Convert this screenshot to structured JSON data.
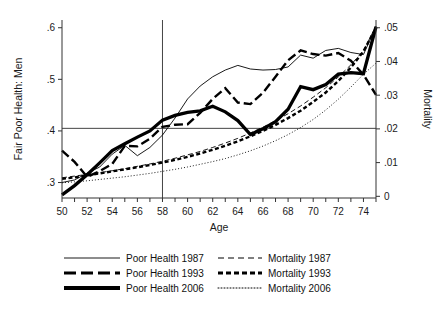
{
  "chart_data": {
    "type": "line",
    "title": "",
    "xlabel": "Age",
    "ylabel": "Fair Poor Health: Men",
    "y2label": "Mortality",
    "xlim": [
      50,
      75
    ],
    "ylim": [
      0.27,
      0.615
    ],
    "y2lim": [
      -0.0005,
      0.0523
    ],
    "grid": false,
    "legend_position": "bottom",
    "x_ticks_major": [
      50,
      52,
      54,
      56,
      58,
      60,
      62,
      64,
      66,
      68,
      70,
      72,
      74
    ],
    "x_ticks_minor": [
      51,
      53,
      55,
      57,
      59,
      61,
      63,
      65,
      67,
      69,
      71,
      73,
      75
    ],
    "x_tick_labels": [
      "50",
      "52",
      "54",
      "56",
      "58",
      "60",
      "62",
      "64",
      "66",
      "68",
      "70",
      "72",
      "74"
    ],
    "y_ticks": [
      0.3,
      0.4,
      0.5,
      0.6
    ],
    "y_tick_labels": [
      ".3",
      ".4",
      ".5",
      ".6"
    ],
    "y2_ticks": [
      0,
      0.01,
      0.02,
      0.03,
      0.04,
      0.05
    ],
    "y2_tick_labels": [
      "0",
      ".01",
      ".02",
      ".03",
      ".04",
      ".05"
    ],
    "reference_lines": [
      {
        "orientation": "vertical",
        "value": 58,
        "axis": "x"
      },
      {
        "orientation": "horizontal",
        "value": 0.405,
        "axis": "y"
      }
    ],
    "x": [
      50,
      51,
      52,
      53,
      54,
      55,
      56,
      57,
      58,
      59,
      60,
      61,
      62,
      63,
      64,
      65,
      66,
      67,
      68,
      69,
      70,
      71,
      72,
      73,
      74,
      75
    ],
    "series": [
      {
        "name": "Poor Health 1987",
        "axis": "left",
        "style": "solid",
        "width": "thin",
        "values": [
          0.3,
          0.305,
          0.318,
          0.33,
          0.355,
          0.372,
          0.352,
          0.368,
          0.392,
          0.425,
          0.462,
          0.487,
          0.505,
          0.518,
          0.527,
          0.52,
          0.518,
          0.519,
          0.524,
          0.547,
          0.541,
          0.556,
          0.56,
          0.552,
          0.548,
          0.602
        ]
      },
      {
        "name": "Poor Health 1993",
        "axis": "left",
        "style": "dashed-long",
        "width": "medium",
        "values": [
          0.362,
          0.34,
          0.311,
          0.322,
          0.336,
          0.371,
          0.37,
          0.385,
          0.408,
          0.412,
          0.413,
          0.435,
          0.462,
          0.483,
          0.455,
          0.452,
          0.474,
          0.505,
          0.537,
          0.556,
          0.549,
          0.546,
          0.551,
          0.536,
          0.509,
          0.47
        ]
      },
      {
        "name": "Poor Health 2006",
        "axis": "left",
        "style": "solid",
        "width": "thick",
        "values": [
          0.276,
          0.294,
          0.315,
          0.338,
          0.362,
          0.375,
          0.388,
          0.4,
          0.421,
          0.43,
          0.436,
          0.439,
          0.448,
          0.437,
          0.42,
          0.393,
          0.404,
          0.418,
          0.442,
          0.486,
          0.48,
          0.49,
          0.51,
          0.513,
          0.511,
          0.602
        ]
      },
      {
        "name": "Mortality 1987",
        "axis": "right",
        "style": "dashed-medium",
        "width": "thin",
        "values": [
          0.0055,
          0.006,
          0.0065,
          0.007,
          0.0076,
          0.0082,
          0.0089,
          0.0096,
          0.0104,
          0.0113,
          0.0123,
          0.0133,
          0.0145,
          0.0158,
          0.0172,
          0.0188,
          0.0205,
          0.0224,
          0.0245,
          0.0268,
          0.0294,
          0.0322,
          0.0354,
          0.039,
          0.0432,
          0.0505
        ]
      },
      {
        "name": "Mortality 1993",
        "axis": "right",
        "style": "dashed-short",
        "width": "medium",
        "values": [
          0.0052,
          0.0056,
          0.0062,
          0.0068,
          0.0074,
          0.008,
          0.0086,
          0.0093,
          0.01,
          0.0108,
          0.0117,
          0.0127,
          0.0138,
          0.015,
          0.0163,
          0.0178,
          0.0194,
          0.0212,
          0.0232,
          0.0254,
          0.028,
          0.0308,
          0.0342,
          0.0382,
          0.043,
          0.05
        ]
      },
      {
        "name": "Mortality 2006",
        "axis": "right",
        "style": "dotted",
        "width": "thin",
        "values": [
          0.004,
          0.0043,
          0.0046,
          0.005,
          0.0054,
          0.0058,
          0.0063,
          0.0068,
          0.0074,
          0.008,
          0.0087,
          0.0095,
          0.0103,
          0.0112,
          0.0123,
          0.0135,
          0.0149,
          0.0165,
          0.0183,
          0.0204,
          0.0228,
          0.0256,
          0.0288,
          0.0324,
          0.0362,
          0.0395
        ]
      }
    ]
  },
  "legend": {
    "entries": [
      {
        "label": "Poor Health 1987",
        "style": "solid-thin"
      },
      {
        "label": "Mortality 1987",
        "style": "dashed-medium-thin"
      },
      {
        "label": "Poor Health 1993",
        "style": "dashed-long-medium"
      },
      {
        "label": "Mortality 1993",
        "style": "dashed-short-medium"
      },
      {
        "label": "Poor Health 2006",
        "style": "solid-thick"
      },
      {
        "label": "Mortality 2006",
        "style": "dotted-thin"
      }
    ]
  },
  "axes": {
    "y_label": "Fair Poor Health: Men",
    "x_label": "Age",
    "y2_label": "Mortality",
    "y_tick_labels": [
      ".6",
      ".5",
      ".4",
      ".3"
    ],
    "y2_tick_labels": [
      ".05",
      ".04",
      ".03",
      ".02",
      ".01",
      "0"
    ],
    "x_tick_labels": [
      "50",
      "52",
      "54",
      "56",
      "58",
      "60",
      "62",
      "64",
      "66",
      "68",
      "70",
      "72",
      "74"
    ]
  },
  "colors": {
    "ink": "#000000",
    "axis": "#333333",
    "background": "#ffffff"
  }
}
